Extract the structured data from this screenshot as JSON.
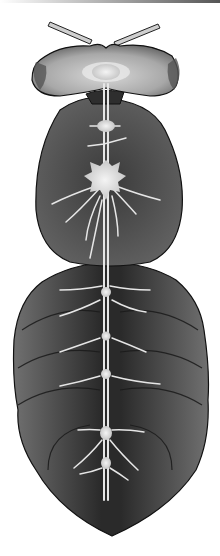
{
  "image": {
    "subject": "insect-nervous-system-illustration",
    "parts": [
      "antennae",
      "head",
      "thorax",
      "abdomen",
      "ventral-nerve-cord",
      "ganglia"
    ],
    "colors": {
      "background": "#ffffff",
      "body_dark": "#2a2a2a",
      "body_mid": "#5a5a5a",
      "head_light": "#b8b8b8",
      "nerve": "#e6e6e6",
      "outline": "#111111"
    }
  }
}
